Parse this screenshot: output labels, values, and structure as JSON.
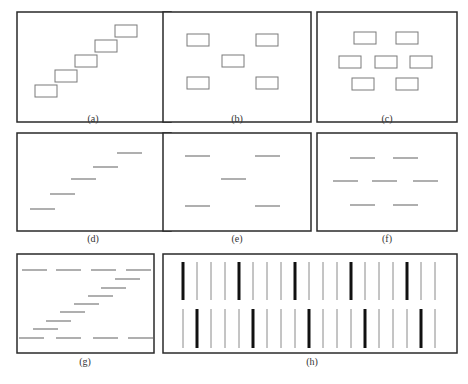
{
  "figure": {
    "panels": [
      {
        "id": "a",
        "label": "(a)",
        "box": [
          17,
          12,
          154,
          110
        ],
        "caption_pos": [
          93,
          120
        ],
        "shape": "rect",
        "items": [
          [
            35,
            85,
            22,
            12
          ],
          [
            55,
            70,
            22,
            12
          ],
          [
            75,
            55,
            22,
            12
          ],
          [
            95,
            40,
            22,
            12
          ],
          [
            115,
            25,
            22,
            12
          ]
        ]
      },
      {
        "id": "b",
        "label": "(b)",
        "box": [
          163,
          12,
          148,
          110
        ],
        "caption_pos": [
          237,
          120
        ],
        "shape": "rect",
        "items": [
          [
            187,
            34,
            22,
            12
          ],
          [
            256,
            34,
            22,
            12
          ],
          [
            222,
            55,
            22,
            12
          ],
          [
            187,
            77,
            22,
            12
          ],
          [
            256,
            77,
            22,
            12
          ]
        ]
      },
      {
        "id": "c",
        "label": "(c)",
        "box": [
          317,
          12,
          140,
          110
        ],
        "caption_pos": [
          387,
          120
        ],
        "shape": "rect",
        "items": [
          [
            354,
            32,
            22,
            12
          ],
          [
            396,
            32,
            22,
            12
          ],
          [
            339,
            56,
            22,
            12
          ],
          [
            375,
            56,
            22,
            12
          ],
          [
            410,
            56,
            22,
            12
          ],
          [
            352,
            78,
            22,
            12
          ],
          [
            396,
            78,
            22,
            12
          ]
        ]
      },
      {
        "id": "d",
        "label": "(d)",
        "box": [
          17,
          133,
          154,
          98
        ],
        "caption_pos": [
          93,
          240
        ],
        "shape": "line",
        "items": [
          [
            30,
            209,
            25
          ],
          [
            50,
            194,
            25
          ],
          [
            71,
            179,
            25
          ],
          [
            93,
            167,
            25
          ],
          [
            117,
            153,
            25
          ]
        ]
      },
      {
        "id": "e",
        "label": "(e)",
        "box": [
          163,
          133,
          148,
          98
        ],
        "caption_pos": [
          237,
          240
        ],
        "shape": "line",
        "items": [
          [
            185,
            156,
            25
          ],
          [
            255,
            156,
            25
          ],
          [
            221,
            179,
            25
          ],
          [
            185,
            206,
            25
          ],
          [
            255,
            206,
            25
          ]
        ]
      },
      {
        "id": "f",
        "label": "(f)",
        "box": [
          317,
          133,
          140,
          98
        ],
        "caption_pos": [
          387,
          240
        ],
        "shape": "line",
        "items": [
          [
            350,
            158,
            25
          ],
          [
            393,
            158,
            25
          ],
          [
            333,
            181,
            25
          ],
          [
            372,
            181,
            25
          ],
          [
            413,
            181,
            25
          ],
          [
            350,
            205,
            25
          ],
          [
            393,
            205,
            25
          ]
        ]
      },
      {
        "id": "g",
        "label": "(g)",
        "box": [
          17,
          254,
          137,
          99
        ],
        "caption_pos": [
          85,
          363
        ],
        "shape": "line",
        "items": [
          [
            22,
            270,
            25
          ],
          [
            56,
            270,
            25
          ],
          [
            91,
            270,
            25
          ],
          [
            126,
            270,
            25
          ],
          [
            115,
            279,
            25
          ],
          [
            101,
            288,
            25
          ],
          [
            88,
            296,
            25
          ],
          [
            74,
            304,
            25
          ],
          [
            60,
            312,
            25
          ],
          [
            46,
            321,
            25
          ],
          [
            33,
            329,
            25
          ],
          [
            19,
            338,
            25
          ],
          [
            56,
            338,
            25
          ],
          [
            93,
            338,
            25
          ],
          [
            128,
            338,
            25
          ]
        ]
      },
      {
        "id": "h",
        "label": "(h)",
        "box": [
          163,
          254,
          294,
          99
        ],
        "caption_pos": [
          312,
          363
        ],
        "shape": "bars",
        "spacing": 14,
        "top_row": {
          "y1": 262,
          "y2": 300,
          "x_start": 183,
          "count": 19,
          "thick_every": 4,
          "thick_offset": 0
        },
        "bottom_row": {
          "y1": 309,
          "y2": 348,
          "x_start": 183,
          "count": 19,
          "thick_every": 4,
          "thick_offset": 1
        }
      }
    ],
    "colors": {
      "frame": "#2a2a2a",
      "shape": "#7a7a7a",
      "thick_bar": "#111111",
      "thin_bar": "#8a8a8a",
      "caption": "#333333"
    }
  }
}
